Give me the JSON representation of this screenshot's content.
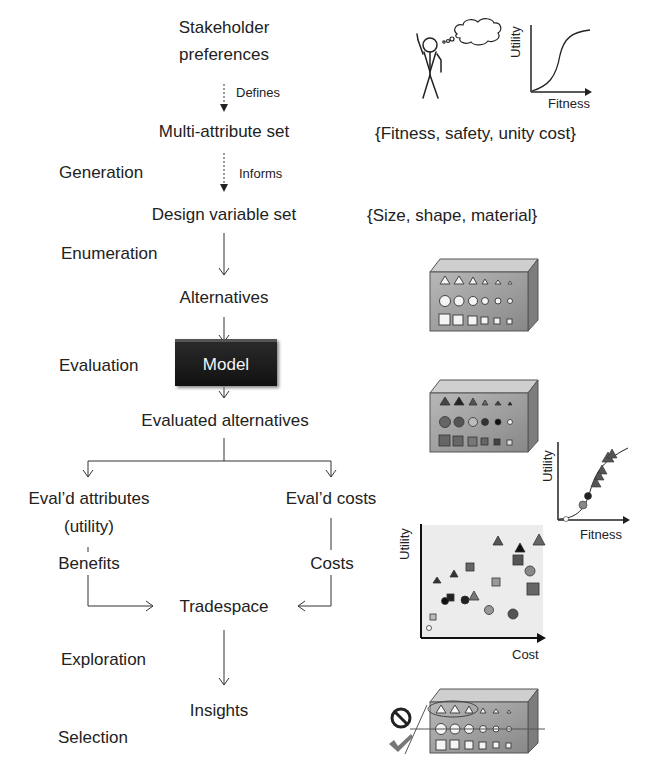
{
  "flow": {
    "stakeholder_line1": "Stakeholder",
    "stakeholder_line2": "preferences",
    "defines": "Defines",
    "multi_attribute_set": "Multi-attribute set",
    "informs": "Informs",
    "design_variable_set": "Design variable set",
    "alternatives": "Alternatives",
    "model": "Model",
    "evaluated_alternatives": "Evaluated alternatives",
    "evald_attributes_line1": "Eval’d attributes",
    "evald_attributes_line2": "(utility)",
    "evald_costs": "Eval’d costs",
    "benefits": "Benefits",
    "costs": "Costs",
    "tradespace": "Tradespace",
    "insights": "Insights"
  },
  "stages": {
    "generation": "Generation",
    "enumeration": "Enumeration",
    "evaluation": "Evaluation",
    "exploration": "Exploration",
    "selection": "Selection"
  },
  "annotations": {
    "attribute_set": "{Fitness, safety, unity cost}",
    "design_set": "{Size, shape, material}",
    "utility_curve_ylabel": "Utility",
    "utility_curve_xlabel": "Fitness",
    "evaluated_curve_ylabel": "Utility",
    "evaluated_curve_xlabel": "Fitness",
    "tradespace_ylabel": "Utility",
    "tradespace_xlabel": "Cost"
  },
  "icons": {
    "stakeholder": "stick-figure-icon",
    "thought": "thought-bubble-icon",
    "reject": "prohibited-icon",
    "accept": "checkmark-icon"
  },
  "colors": {
    "text": "#222222",
    "model_box": "#1a1a1a",
    "block_face": "#9a9a9a",
    "block_top": "#c8c8c8",
    "block_side": "#7a7a7a",
    "plot_bg": "#eeeeee",
    "marker_dark": "#333333",
    "marker_mid": "#666666",
    "marker_light": "#999999"
  }
}
